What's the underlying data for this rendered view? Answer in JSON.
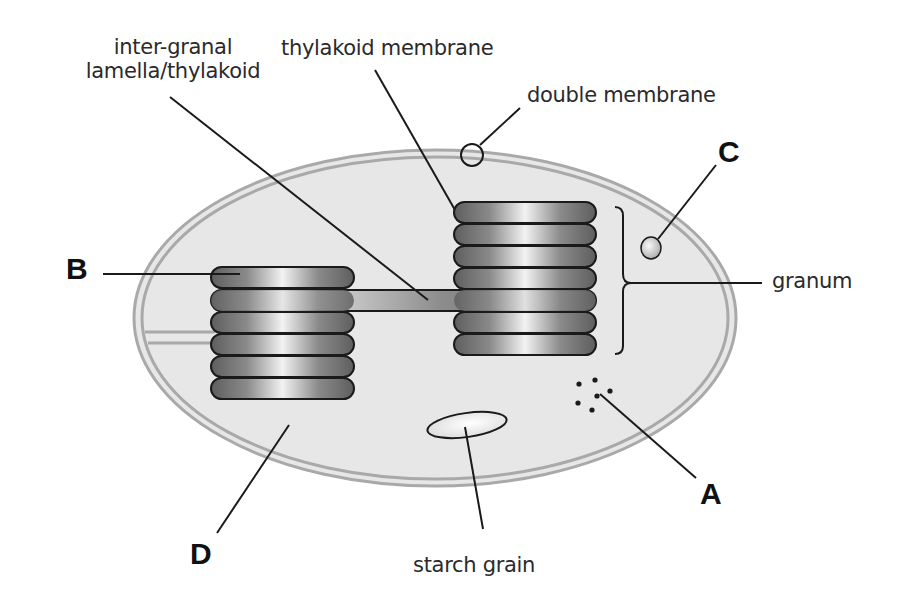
{
  "diagram": {
    "labels": {
      "inter_granal_line1": "inter-granal",
      "inter_granal_line2": "lamella/thylakoid",
      "thylakoid_membrane": "thylakoid membrane",
      "double_membrane": "double membrane",
      "granum": "granum",
      "starch_grain": "starch grain"
    },
    "letters": {
      "A": "A",
      "B": "B",
      "C": "C",
      "D": "D"
    },
    "colors": {
      "stroma_fill": "#e6e6e6",
      "membrane": "#a8a8a8",
      "thylakoid_dark": "#6e6e6e",
      "thylakoid_light": "#f4f4f4",
      "leader_line": "#1a1a1a"
    },
    "structure": {
      "left_granum_thylakoids": 6,
      "right_granum_thylakoids": 7,
      "ribosome_dots": 6
    }
  }
}
